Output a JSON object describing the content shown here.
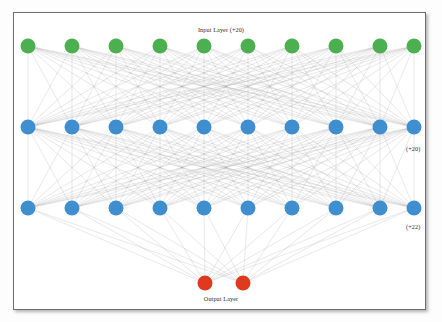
{
  "diagram": {
    "type": "neural-network-architecture",
    "title_top": "Input Layer (+20)",
    "title_bottom": "Output Layer",
    "side_label_hidden1": "(+20)",
    "side_label_hidden2": "(+22)",
    "colors": {
      "input_node": "#4cb050",
      "hidden_node": "#3f8fd0",
      "output_node": "#e03a1e",
      "edge": "#9a9a9a",
      "frame_border": "#6f6f6f",
      "background": "#ffffff",
      "label_text": "#2b2b2b"
    },
    "layers": [
      {
        "name": "input-layer",
        "label": "Input Layer (+20)",
        "node_count": 10,
        "visible_node_count": 10,
        "node_color": "#4cb050",
        "y": 46,
        "radius": 7.5
      },
      {
        "name": "hidden-layer-1",
        "label": "(+20)",
        "node_count": 10,
        "visible_node_count": 10,
        "node_color": "#3f8fd0",
        "y": 127,
        "radius": 7.5
      },
      {
        "name": "hidden-layer-2",
        "label": "(+22)",
        "node_count": 10,
        "visible_node_count": 10,
        "node_color": "#3f8fd0",
        "y": 208,
        "radius": 7.5
      },
      {
        "name": "output-layer",
        "label": "Output Layer",
        "node_count": 2,
        "visible_node_count": 2,
        "node_color": "#e03a1e",
        "y": 283,
        "radius": 7.5
      }
    ],
    "node_x_positions": {
      "wide_rows": [
        28,
        72,
        116,
        160,
        204,
        248,
        292,
        336,
        380,
        414
      ],
      "output_row": [
        205,
        243
      ]
    },
    "edges": {
      "style": "fully-connected",
      "stroke": "#9a9a9a",
      "stroke_width": 0.4,
      "opacity": 0.55
    }
  }
}
